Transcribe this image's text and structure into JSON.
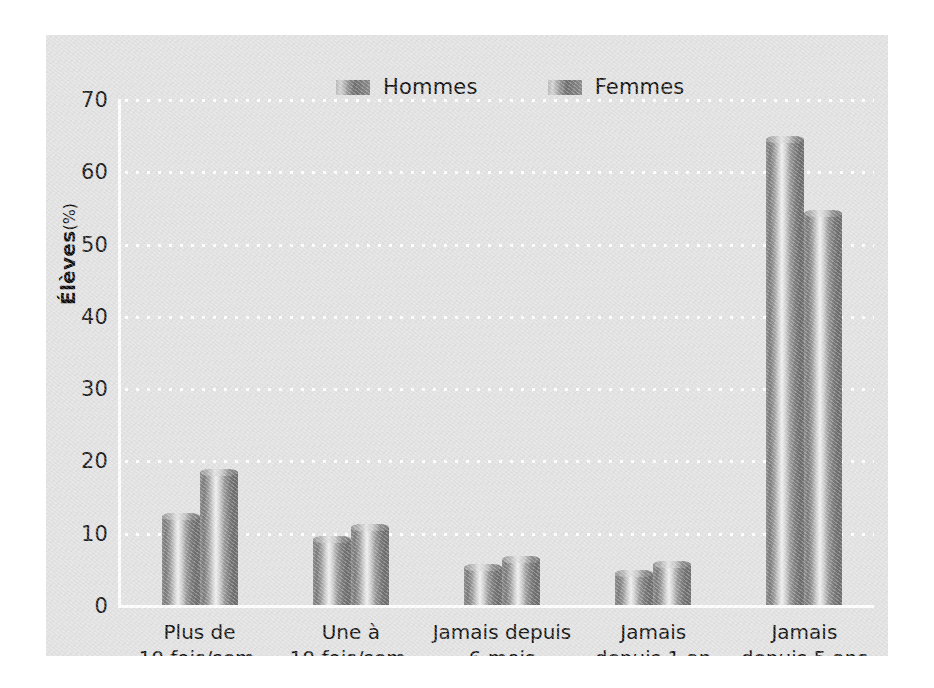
{
  "figure": {
    "background_color": "#ffffff",
    "panel_color": "#e2e2e2",
    "gridline_color": "#ffffff",
    "axis_color": "#fdfdfd"
  },
  "ylabel": {
    "main": "Élèves",
    "unit": "(%)"
  },
  "legend": {
    "items": [
      {
        "label": "Hommes",
        "swatch": "bar-gradient-swatch"
      },
      {
        "label": "Femmes",
        "swatch": "bar-gradient-swatch"
      }
    ]
  },
  "chart_data": {
    "type": "bar",
    "title": "",
    "subtitle": "",
    "xlabel": "",
    "ylabel": "Élèves (%)",
    "ylim": [
      0,
      70
    ],
    "yticks": [
      0,
      10,
      20,
      30,
      40,
      50,
      60,
      70
    ],
    "ytick_labels": [
      "0",
      "10",
      "20",
      "30",
      "40",
      "50",
      "60",
      "70"
    ],
    "grid": "horizontal-dotted-white",
    "legend_position": "top-center",
    "categories": [
      "Plus de\n10 fois/sem.",
      "Une à\n10 fois/sem.",
      "Jamais depuis\n6 mois",
      "Jamais\ndepuis 1 an",
      "Jamais\ndepuis 5 ans"
    ],
    "series": [
      {
        "name": "Hommes",
        "values": [
          12.3,
          9.2,
          5.2,
          4.4,
          64.5
        ]
      },
      {
        "name": "Femmes",
        "values": [
          18.4,
          10.8,
          6.4,
          5.7,
          54.2
        ]
      }
    ]
  }
}
